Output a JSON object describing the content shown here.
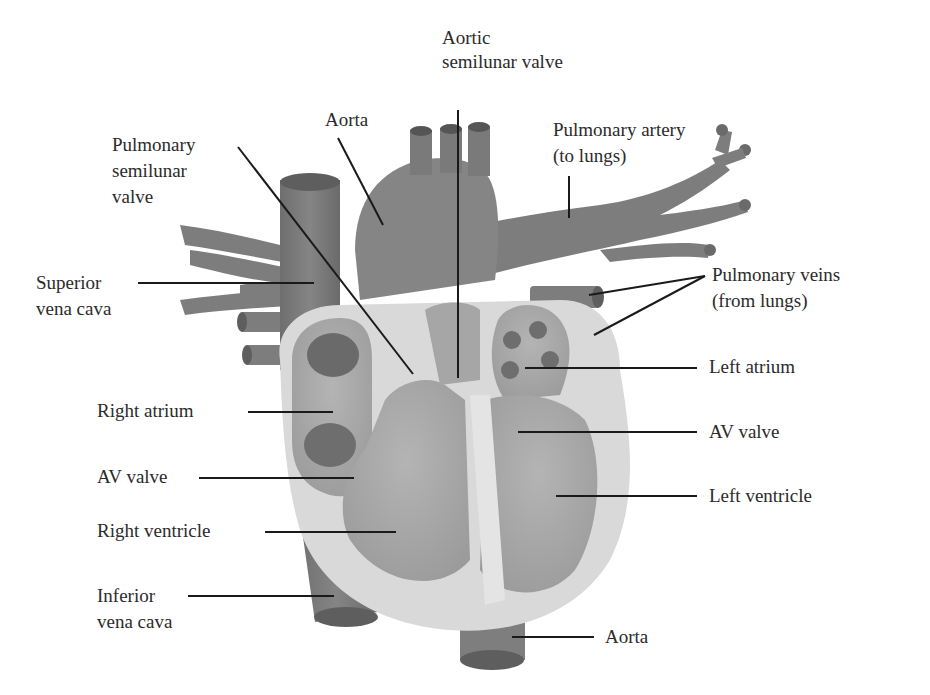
{
  "diagram": {
    "colors": {
      "background": "#ffffff",
      "vessel": "#7a7a7a",
      "vessel_dark": "#5e5e5e",
      "chamber": "#a8a8a8",
      "wall": "#dcdcdc",
      "leader_line": "#1a1a1a",
      "text": "#2b2b2b"
    },
    "labels": {
      "aortic_valve": {
        "line1": "Aortic",
        "line2": "semilunar valve"
      },
      "aorta_top": {
        "line1": "Aorta"
      },
      "pulmonary_valve": {
        "line1": "Pulmonary",
        "line2": "semilunar",
        "line3": "valve"
      },
      "pulmonary_artery": {
        "line1": "Pulmonary artery",
        "line2": "(to lungs)"
      },
      "superior_vena_cava": {
        "line1": "Superior",
        "line2": "vena cava"
      },
      "pulmonary_veins": {
        "line1": "Pulmonary veins",
        "line2": "(from lungs)"
      },
      "left_atrium": {
        "line1": "Left atrium"
      },
      "right_atrium": {
        "line1": "Right atrium"
      },
      "av_valve_right": {
        "line1": "AV valve"
      },
      "av_valve_left": {
        "line1": "AV valve"
      },
      "left_ventricle": {
        "line1": "Left ventricle"
      },
      "right_ventricle": {
        "line1": "Right ventricle"
      },
      "inferior_vena_cava": {
        "line1": "Inferior",
        "line2": "vena cava"
      },
      "aorta_bottom": {
        "line1": "Aorta"
      }
    }
  }
}
